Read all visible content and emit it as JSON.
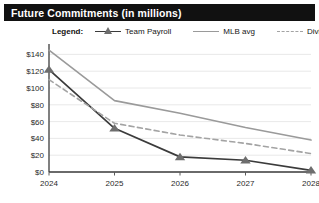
{
  "header": {
    "title": "Future Commitments (in millions)",
    "bar_color": "#111111",
    "text_color": "#ffffff"
  },
  "legend": {
    "title": "Legend:",
    "position": "top",
    "entries": [
      {
        "label": "Team Payroll",
        "style": "solid-marker",
        "color": "#3b3b3b",
        "marker": "triangle"
      },
      {
        "label": "MLB avg",
        "style": "solid",
        "color": "#9a9a9a",
        "marker": "none"
      },
      {
        "label": "Division avg",
        "style": "dashed",
        "color": "#a3a3a3",
        "marker": "none"
      }
    ]
  },
  "axes": {
    "y_ticks": [
      "$0",
      "$20",
      "$40",
      "$60",
      "$80",
      "$100",
      "$120",
      "$140"
    ],
    "x_ticks": [
      "2024",
      "2025",
      "2026",
      "2027",
      "2028"
    ]
  },
  "chart_data": {
    "type": "line",
    "title": "Future Commitments (in millions)",
    "xlabel": "",
    "ylabel": "",
    "x": [
      2024,
      2025,
      2026,
      2027,
      2028
    ],
    "categories": [
      "2024",
      "2025",
      "2026",
      "2027",
      "2028"
    ],
    "series": [
      {
        "name": "Team Payroll",
        "values": [
          122,
          52,
          18,
          14,
          2
        ],
        "color": "#3b3b3b",
        "line_style": "solid",
        "marker": "triangle",
        "marker_color": "#6e6e6e"
      },
      {
        "name": "MLB avg",
        "values": [
          145,
          85,
          70,
          53,
          38
        ],
        "color": "#9a9a9a",
        "line_style": "solid",
        "marker": "none"
      },
      {
        "name": "Division avg",
        "values": [
          110,
          58,
          44,
          34,
          22
        ],
        "color": "#a3a3a3",
        "line_style": "dashed",
        "marker": "none"
      }
    ],
    "ylim": [
      0,
      150
    ],
    "ytick_values": [
      0,
      20,
      40,
      60,
      80,
      100,
      120,
      140
    ],
    "ytick_labels": [
      "$0",
      "$20",
      "$40",
      "$60",
      "$80",
      "$100",
      "$120",
      "$140"
    ],
    "xtick_labels": [
      "2024",
      "2025",
      "2026",
      "2027",
      "2028"
    ],
    "grid": "horizontal",
    "legend_position": "top"
  }
}
